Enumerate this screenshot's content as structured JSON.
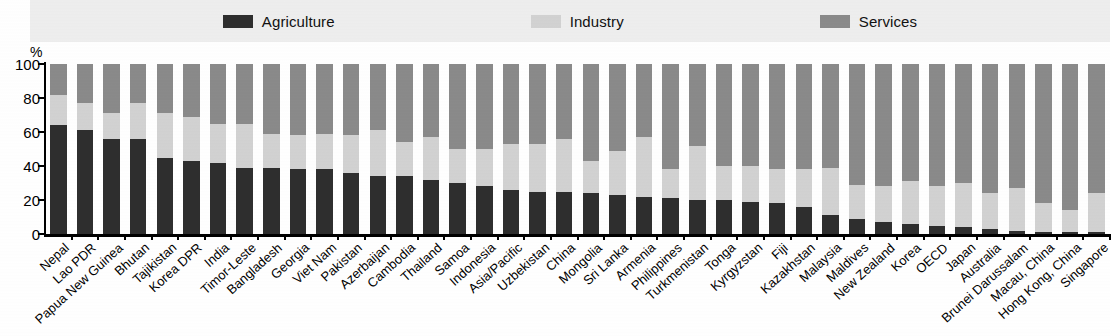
{
  "legend": {
    "items": [
      {
        "label": "Agriculture",
        "color": "#2e2e2e",
        "key": "agriculture"
      },
      {
        "label": "Industry",
        "color": "#d2d2d2",
        "key": "industry"
      },
      {
        "label": "Services",
        "color": "#8a8a8a",
        "key": "services"
      }
    ]
  },
  "axis": {
    "unit": "%",
    "y_ticks": [
      "100",
      "80",
      "60",
      "40",
      "20",
      "0"
    ]
  },
  "chart_data": {
    "type": "bar",
    "subtype": "stacked-100-percent",
    "title": "",
    "xlabel": "",
    "ylabel": "%",
    "ylim": [
      0,
      100
    ],
    "grid": false,
    "legend_position": "top",
    "colors": {
      "agriculture": "#2e2e2e",
      "industry": "#d2d2d2",
      "services": "#8a8a8a"
    },
    "categories": [
      "Nepal",
      "Lao PDR",
      "Papua New Guinea",
      "Bhutan",
      "Tajikistan",
      "Korea DPR",
      "India",
      "Timor-Leste",
      "Bangladesh",
      "Georgia",
      "Viet Nam",
      "Pakistan",
      "Azerbaijan",
      "Cambodia",
      "Thailand",
      "Samoa",
      "Indonesia",
      "Asia/Pacific",
      "Uzbekistan",
      "China",
      "Mongolia",
      "Sri Lanka",
      "Armenia",
      "Philippines",
      "Turkmenistan",
      "Tonga",
      "Kyrgyzstan",
      "Fiji",
      "Kazakhstan",
      "Malaysia",
      "Maldives",
      "New Zealand",
      "Korea",
      "OECD",
      "Japan",
      "Australia",
      "Brunei Darussalam",
      "Macau, China",
      "Hong Kong, China",
      "Singapore"
    ],
    "series": [
      {
        "name": "Agriculture",
        "values": [
          64,
          61,
          56,
          56,
          45,
          43,
          42,
          39,
          39,
          38,
          38,
          36,
          34,
          34,
          32,
          30,
          28,
          26,
          25,
          25,
          24,
          23,
          22,
          21,
          20,
          20,
          19,
          18,
          16,
          11,
          9,
          7,
          6,
          5,
          4,
          3,
          2,
          1,
          1,
          1
        ]
      },
      {
        "name": "Industry",
        "values": [
          18,
          16,
          15,
          21,
          26,
          26,
          23,
          26,
          20,
          20,
          21,
          22,
          27,
          20,
          25,
          20,
          22,
          27,
          28,
          31,
          19,
          26,
          35,
          17,
          32,
          20,
          21,
          20,
          22,
          28,
          20,
          21,
          25,
          23,
          26,
          21,
          25,
          17,
          13,
          23
        ]
      },
      {
        "name": "Services",
        "values": [
          18,
          23,
          29,
          23,
          29,
          31,
          35,
          35,
          41,
          42,
          41,
          42,
          39,
          46,
          43,
          50,
          50,
          47,
          47,
          44,
          57,
          51,
          43,
          62,
          48,
          60,
          60,
          62,
          62,
          61,
          71,
          72,
          69,
          72,
          70,
          76,
          73,
          82,
          86,
          76
        ]
      }
    ]
  }
}
